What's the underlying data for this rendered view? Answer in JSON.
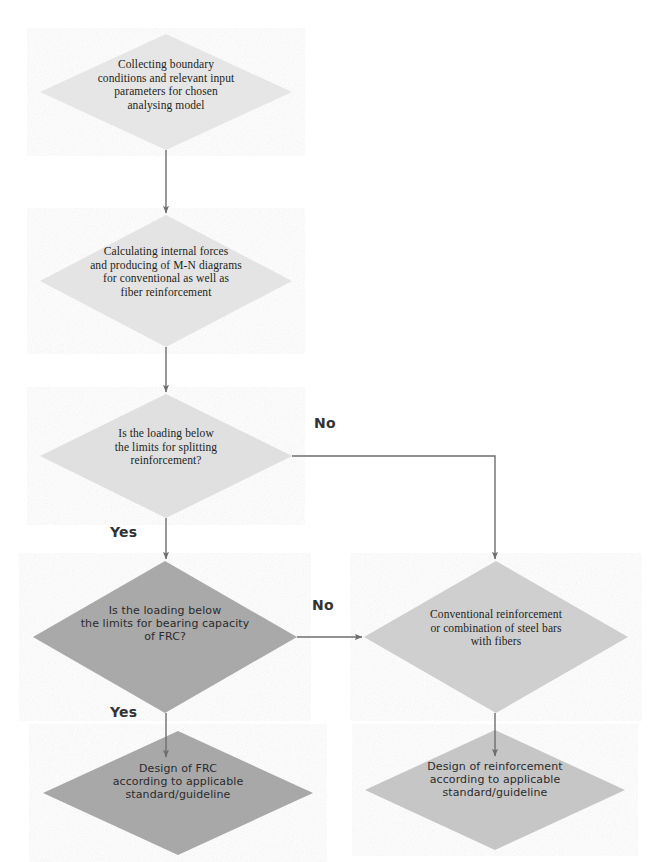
{
  "diagram": {
    "type": "flowchart",
    "background_color": "#ffffff",
    "connector_color": "#6e6e6e",
    "text_color": "#231f20",
    "nodes": [
      {
        "id": "n1",
        "shape": "diamond",
        "text": "Collecting boundary\nconditions and relevant input\nparameters for chosen\nanalysing model",
        "fill": "#e6e6e6",
        "font": "serif",
        "cx": 166,
        "cy": 92,
        "rx": 126,
        "ry": 58
      },
      {
        "id": "n2",
        "shape": "diamond",
        "text": "Calculating internal forces\nand producing of M-N diagrams\nfor conventional as well as\nfiber reinforcement",
        "fill": "#e4e4e4",
        "font": "serif",
        "cx": 166,
        "cy": 281,
        "rx": 126,
        "ry": 66
      },
      {
        "id": "n3",
        "shape": "diamond",
        "text": "Is the loading below\nthe limits for splitting\nreinforcement?",
        "fill": "#e0e0e0",
        "font": "serif",
        "cx": 166,
        "cy": 456,
        "rx": 126,
        "ry": 62
      },
      {
        "id": "n4",
        "shape": "diamond",
        "text": "Is the loading below\nthe limits for bearing capacity\nof FRC?",
        "fill": "#a9a9a9",
        "font": "sans",
        "cx": 165,
        "cy": 637,
        "rx": 132,
        "ry": 76
      },
      {
        "id": "n5",
        "shape": "diamond",
        "text": "Conventional reinforcement\nor combination of steel bars\nwith fibers",
        "fill": "#cfcfcf",
        "font": "serif",
        "cx": 496,
        "cy": 637,
        "rx": 132,
        "ry": 76
      },
      {
        "id": "n6",
        "shape": "diamond",
        "text": "Design of FRC\naccording to applicable\nstandard/guideline",
        "fill": "#a8a8a8",
        "font": "sans",
        "cx": 178,
        "cy": 793,
        "rx": 135,
        "ry": 62
      },
      {
        "id": "n7",
        "shape": "diamond",
        "text": "Design of reinforcement\naccording to applicable\nstandard/guideline",
        "fill": "#c6c6c6",
        "font": "sans",
        "cx": 495,
        "cy": 790,
        "rx": 130,
        "ry": 60
      }
    ],
    "connectors": [
      {
        "id": "c1",
        "from": "n1",
        "to": "n2",
        "kind": "vertical-arrow",
        "label": ""
      },
      {
        "id": "c2",
        "from": "n2",
        "to": "n3",
        "kind": "vertical-arrow",
        "label": ""
      },
      {
        "id": "c3",
        "from": "n3",
        "to": "n5",
        "kind": "elbow-right-down-arrow",
        "label": "No"
      },
      {
        "id": "c4",
        "from": "n3",
        "to": "n4",
        "kind": "vertical-arrow",
        "label": "Yes"
      },
      {
        "id": "c5",
        "from": "n4",
        "to": "n5",
        "kind": "horizontal-arrow",
        "label": "No"
      },
      {
        "id": "c6",
        "from": "n4",
        "to": "n6",
        "kind": "vertical-arrow",
        "label": "Yes"
      },
      {
        "id": "c7",
        "from": "n5",
        "to": "n7",
        "kind": "vertical-arrow",
        "label": ""
      }
    ],
    "labels": {
      "no_split": "No",
      "yes_split": "Yes",
      "no_bearing": "No",
      "yes_bearing": "Yes"
    }
  }
}
